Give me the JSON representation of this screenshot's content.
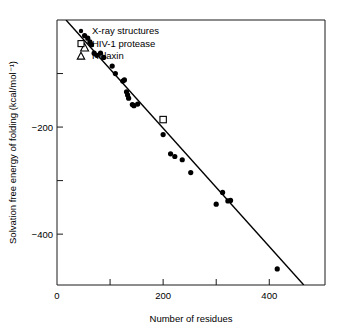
{
  "chart_data": {
    "type": "scatter",
    "title": "",
    "xlabel": "Number of residues",
    "ylabel": "Solvation free energy of folding (kcal/mol⁻¹)",
    "xlim": [
      0,
      505
    ],
    "ylim": [
      -495,
      0
    ],
    "grid": false,
    "x_ticks": [
      {
        "value": 0,
        "label": "0",
        "major": true
      },
      {
        "value": 100,
        "label": "",
        "major": false
      },
      {
        "value": 200,
        "label": "200",
        "major": true
      },
      {
        "value": 300,
        "label": "",
        "major": false
      },
      {
        "value": 400,
        "label": "400",
        "major": true
      }
    ],
    "y_ticks": [
      {
        "value": -100,
        "label": "",
        "major": false
      },
      {
        "value": -200,
        "label": "−200",
        "major": true
      },
      {
        "value": -300,
        "label": "",
        "major": false
      },
      {
        "value": -400,
        "label": "−400",
        "major": true
      }
    ],
    "legend_position": "top-left",
    "series": [
      {
        "name": "X-ray structures",
        "marker": "filled-circle",
        "color": "#000000",
        "points": [
          [
            52,
            -29
          ],
          [
            58,
            -34
          ],
          [
            62,
            -41
          ],
          [
            65,
            -46
          ],
          [
            70,
            -62
          ],
          [
            75,
            -66
          ],
          [
            82,
            -62
          ],
          [
            88,
            -70
          ],
          [
            104,
            -86
          ],
          [
            110,
            -100
          ],
          [
            124,
            -114
          ],
          [
            127,
            -112
          ],
          [
            131,
            -134
          ],
          [
            133,
            -140
          ],
          [
            135,
            -146
          ],
          [
            142,
            -158
          ],
          [
            145,
            -160
          ],
          [
            152,
            -157
          ],
          [
            200,
            -214
          ],
          [
            214,
            -250
          ],
          [
            222,
            -255
          ],
          [
            236,
            -261
          ],
          [
            252,
            -285
          ],
          [
            300,
            -344
          ],
          [
            312,
            -322
          ],
          [
            322,
            -338
          ],
          [
            327,
            -337
          ],
          [
            415,
            -465
          ]
        ]
      },
      {
        "name": "HIV-1 protease",
        "marker": "open-square",
        "color": "#000000",
        "points": [
          [
            200,
            -186
          ]
        ]
      },
      {
        "name": "Relaxin",
        "marker": "open-triangle",
        "color": "#000000",
        "points": [
          [
            52,
            -52
          ]
        ]
      }
    ],
    "fit_line": {
      "label": "",
      "x_start": 17,
      "y_start": 0,
      "x_end": 465,
      "y_end": -495
    }
  },
  "legend": {
    "entries": [
      {
        "label": "X-ray structures",
        "marker": "filled-circle"
      },
      {
        "label": "HIV-1 protease",
        "marker": "open-square"
      },
      {
        "label": "Relaxin",
        "marker": "open-triangle"
      }
    ]
  }
}
